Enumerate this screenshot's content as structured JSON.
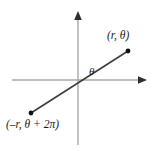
{
  "figure": {
    "type": "polar-coordinates-diagram",
    "background_color": "#ffffff",
    "axis_color": "#a9a9a9",
    "ray_color": "#3c3c3c",
    "point_color": "#1a1a1a",
    "label_color": "#1a1a1a"
  },
  "axes": {
    "origin": {
      "x": 78,
      "y": 80
    },
    "x_axis": {
      "start": {
        "x": 12,
        "y": 80
      },
      "end": {
        "x": 147,
        "y": 80
      },
      "arrow_at": "end"
    },
    "y_axis": {
      "start": {
        "x": 78,
        "y": 145
      },
      "end": {
        "x": 78,
        "y": 11
      },
      "arrow_at": "end"
    }
  },
  "ray": {
    "upper_end": {
      "x": 128,
      "y": 51
    },
    "lower_end": {
      "x": 31,
      "y": 113
    }
  },
  "points": [
    {
      "name": "point-upper",
      "label": "(r, θ)",
      "marker": {
        "x": 128,
        "y": 51
      }
    },
    {
      "name": "point-lower",
      "label": "(–r, θ + 2π)",
      "marker": {
        "x": 31,
        "y": 113
      }
    }
  ],
  "angle": {
    "label": "θ"
  }
}
